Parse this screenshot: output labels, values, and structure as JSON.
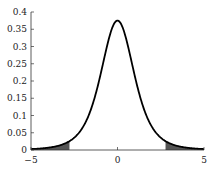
{
  "chart_data": {
    "type": "line",
    "title": "",
    "xlabel": "",
    "ylabel": "",
    "xlim": [
      -5,
      5
    ],
    "ylim": [
      0,
      0.4
    ],
    "grid": false,
    "legend": null,
    "x_ticks": [
      "-5",
      "0",
      "5"
    ],
    "y_ticks": [
      "0",
      "0.05",
      "0.1",
      "0.15",
      "0.2",
      "0.25",
      "0.3",
      "0.35",
      "0.4"
    ],
    "series": [
      {
        "name": "t density (df=4)",
        "df": 4,
        "peak": 0.375,
        "color": "#000000"
      }
    ],
    "shaded_regions": [
      {
        "from": -5,
        "to": -2.776,
        "color": "#555555"
      },
      {
        "from": 2.776,
        "to": 5,
        "color": "#555555"
      }
    ]
  }
}
